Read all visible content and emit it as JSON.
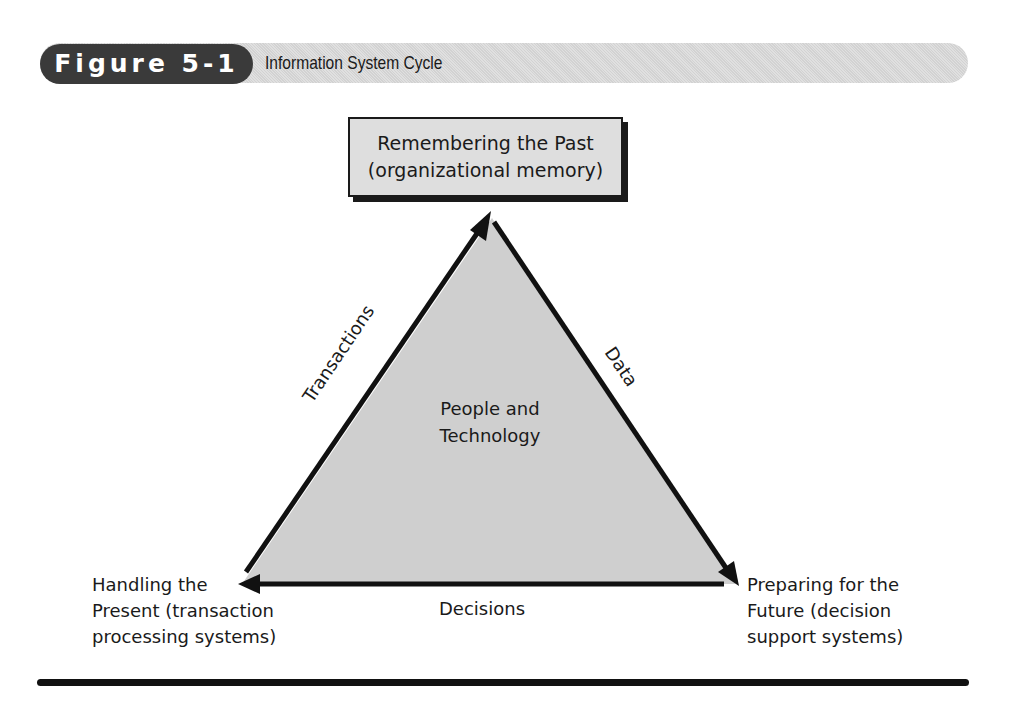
{
  "figure": {
    "number_label": "Figure 5-1",
    "title": "Information System Cycle"
  },
  "diagram": {
    "top_node": {
      "line1": "Remembering the Past",
      "line2": "(organizational memory)"
    },
    "center": {
      "line1": "People and",
      "line2": "Technology"
    },
    "left_node": {
      "line1": "Handling the",
      "line2": "Present (transaction",
      "line3": "processing systems)"
    },
    "right_node": {
      "line1": "Preparing for the",
      "line2": "Future (decision",
      "line3": "support systems)"
    },
    "edges": {
      "left": "Transactions",
      "right": "Data",
      "bottom": "Decisions"
    },
    "colors": {
      "triangle_fill": "#cfcfcf",
      "stroke": "#111111",
      "header_bar": "#d9d9d9",
      "figure_pill": "#3a3a3a"
    }
  }
}
